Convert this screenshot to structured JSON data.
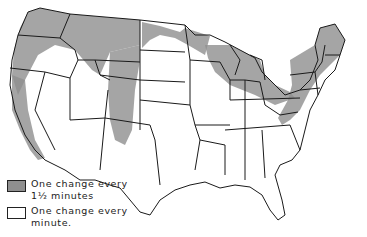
{
  "map": {
    "subject": "United States",
    "colors": {
      "shaded": "#8f8f8f",
      "unshaded": "#ffffff",
      "border": "#1a1a1a"
    }
  },
  "legend": {
    "items": [
      {
        "label_line1": "One change every",
        "label_line2": "1½ minutes",
        "swatch": "shaded"
      },
      {
        "label_line1": "One change every",
        "label_line2": "minute.",
        "swatch": "unshaded"
      }
    ]
  }
}
